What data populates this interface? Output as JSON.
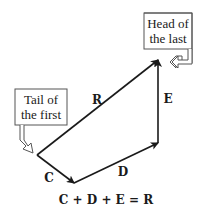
{
  "diagram": {
    "callouts": {
      "head": {
        "line1": "Head of",
        "line2": "the last"
      },
      "tail": {
        "line1": "Tail of",
        "line2": "the first"
      }
    },
    "vectors": [
      {
        "name": "C",
        "from": [
          37,
          155
        ],
        "to": [
          74,
          183
        ]
      },
      {
        "name": "D",
        "from": [
          74,
          183
        ],
        "to": [
          158,
          143
        ]
      },
      {
        "name": "E",
        "from": [
          158,
          143
        ],
        "to": [
          158,
          60
        ]
      },
      {
        "name": "R",
        "from": [
          37,
          155
        ],
        "to": [
          158,
          60
        ]
      }
    ],
    "labels": {
      "C": "C",
      "D": "D",
      "E": "E",
      "R": "R"
    },
    "equation": "C + D + E = R",
    "colors": {
      "stroke": "#1a1a1a",
      "callout_border": "#555555",
      "background": "#ffffff"
    }
  }
}
